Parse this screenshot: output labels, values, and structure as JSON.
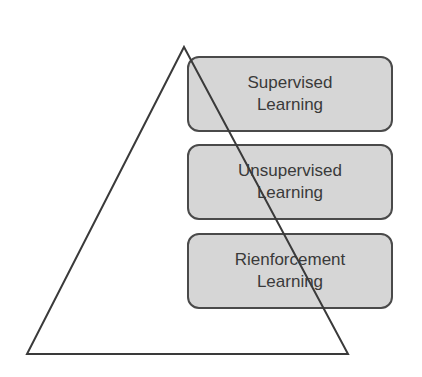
{
  "diagram": {
    "type": "pyramid-with-layers",
    "shape": "triangle",
    "colors": {
      "box_fill": "#d6d6d6",
      "box_border": "#4a4a4a",
      "line": "#3a3a3a",
      "text": "#3a3a3a",
      "background": "#ffffff"
    },
    "layers": [
      {
        "line1": "Supervised",
        "line2": "Learning"
      },
      {
        "line1": "Unsupervised",
        "line2": "Learning"
      },
      {
        "line1": "Rienforcement",
        "line2": "Learning"
      }
    ]
  }
}
